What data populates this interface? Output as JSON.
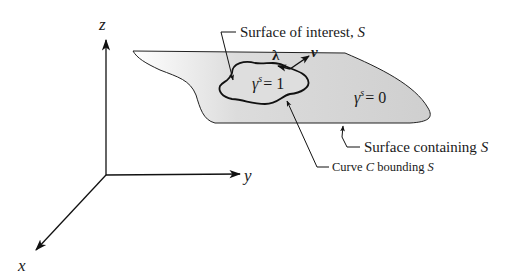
{
  "axes": {
    "z_label": "z",
    "y_label": "y",
    "x_label": "x"
  },
  "surface": {
    "fill_color": "#d4d4d4",
    "stroke_color": "#222222"
  },
  "labels": {
    "surface_of_interest": "Surface of interest, ",
    "surface_of_interest_symbol": "S",
    "surface_containing": "Surface containing ",
    "surface_containing_symbol": "S",
    "curve_prefix": "Curve ",
    "curve_symbol": "C",
    "curve_suffix": " bounding ",
    "curve_bounding_symbol": "S",
    "gamma_inside": {
      "base": "γ",
      "sup": "s",
      "rhs": "= 1"
    },
    "gamma_outside": {
      "base": "γ",
      "sup": "s",
      "rhs": "= 0"
    },
    "lambda": "λ",
    "nu": "ν"
  }
}
